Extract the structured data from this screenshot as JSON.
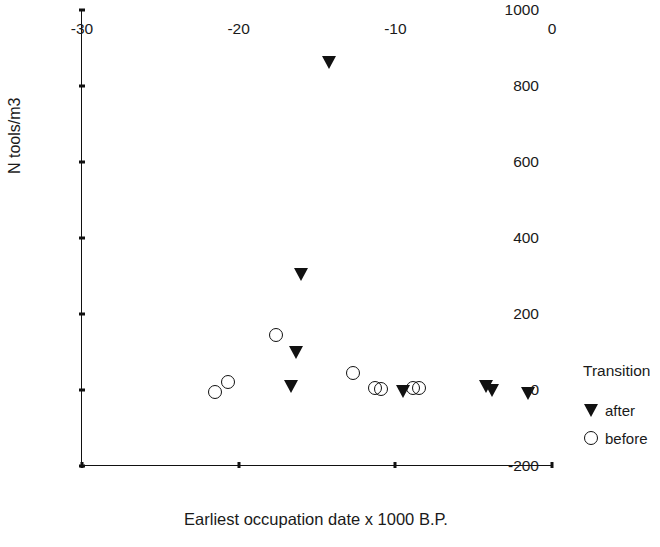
{
  "chart_data": {
    "type": "scatter",
    "title": "",
    "xlabel": "Earliest occupation date x 1000 B.P.",
    "ylabel": "N tools/m3",
    "xlim": [
      -30,
      0
    ],
    "ylim": [
      -200,
      1000
    ],
    "xticks": [
      -30,
      -20,
      -10,
      0
    ],
    "xtick_labels": [
      "-30",
      "-20",
      "-10",
      "0"
    ],
    "yticks": [
      -200,
      0,
      200,
      400,
      600,
      800,
      1000
    ],
    "ytick_labels": [
      "-200",
      "0",
      "200",
      "400",
      "600",
      "800",
      "1000"
    ],
    "grid": false,
    "legend": {
      "title": "Transition",
      "position": "right",
      "entries": [
        {
          "label": "after",
          "marker": "filled-down-triangle",
          "color": "#111111"
        },
        {
          "label": "before",
          "marker": "open-circle",
          "color": "#111111"
        }
      ]
    },
    "series": [
      {
        "name": "after",
        "marker": "filled-down-triangle",
        "color": "#111111",
        "points": [
          {
            "x": -14.2,
            "y": 862
          },
          {
            "x": -16.0,
            "y": 305
          },
          {
            "x": -16.3,
            "y": 100
          },
          {
            "x": -16.6,
            "y": 10
          },
          {
            "x": -9.5,
            "y": -5
          },
          {
            "x": -4.2,
            "y": 8
          },
          {
            "x": -3.8,
            "y": -2
          },
          {
            "x": -1.5,
            "y": -8
          }
        ]
      },
      {
        "name": "before",
        "marker": "open-circle",
        "color": "#111111",
        "points": [
          {
            "x": -17.6,
            "y": 145
          },
          {
            "x": -21.5,
            "y": -5
          },
          {
            "x": -20.7,
            "y": 20
          },
          {
            "x": -12.7,
            "y": 45
          },
          {
            "x": -11.3,
            "y": 5
          },
          {
            "x": -10.9,
            "y": 2
          },
          {
            "x": -8.9,
            "y": 5
          },
          {
            "x": -8.5,
            "y": 5
          }
        ]
      }
    ]
  },
  "axes": {
    "x_title": "Earliest occupation date x 1000 B.P.",
    "y_title": "N tools/m3"
  },
  "legend": {
    "title": "Transition",
    "after_label": "after",
    "before_label": "before"
  },
  "colors": {
    "marker": "#111111",
    "axis": "#111111",
    "text": "#1a1a1a",
    "background": "#ffffff"
  }
}
